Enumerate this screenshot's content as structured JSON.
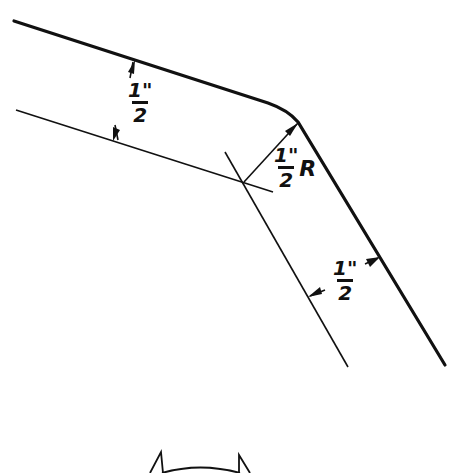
{
  "diagram": {
    "title": "",
    "labels": {
      "top_width": {
        "numerator": "1\"",
        "denominator": "2"
      },
      "bend_radius": {
        "numerator": "1\"",
        "denominator": "2",
        "suffix": "R"
      },
      "bottom_width": {
        "numerator": "1\"",
        "denominator": "2"
      }
    },
    "colors": {
      "line": "#111111",
      "background": "#ffffff"
    }
  }
}
